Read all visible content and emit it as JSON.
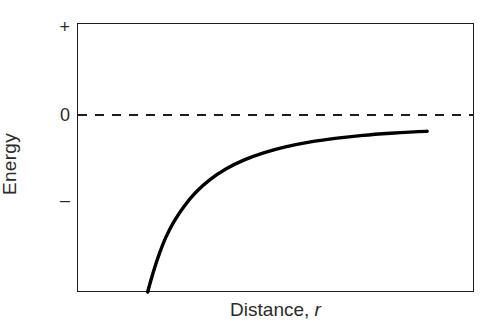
{
  "chart_data": {
    "type": "line",
    "title": "",
    "subtitle": "",
    "xlabel": "Distance, r",
    "xlabel_text": "Distance, ",
    "xlabel_variable": "r",
    "ylabel": "Energy",
    "grid": false,
    "legend": null,
    "xlim": [
      0,
      1
    ],
    "ylim": [
      -1,
      0.52
    ],
    "x_tick_labels": [],
    "y_tick_labels": [
      "+",
      "0",
      "–"
    ],
    "y_tick_values": [
      0.5,
      0,
      -0.48
    ],
    "annotations": [
      {
        "name": "zero-reference-line",
        "style": "dashed",
        "y_value": 0,
        "label": "0"
      }
    ],
    "series": [
      {
        "name": "attractive-potential-energy",
        "style": "solid",
        "color": "#000000",
        "line_width": 3.4,
        "description": "Energy rises steeply from a large negative value at small separation and approaches zero asymptotically at large distance",
        "x": [
          0.178,
          0.186,
          0.196,
          0.208,
          0.224,
          0.245,
          0.27,
          0.3,
          0.335,
          0.375,
          0.42,
          0.47,
          0.525,
          0.585,
          0.65,
          0.72,
          0.79,
          0.86,
          0.882
        ],
        "y": [
          -1.0,
          -0.935,
          -0.86,
          -0.78,
          -0.69,
          -0.6,
          -0.515,
          -0.435,
          -0.365,
          -0.305,
          -0.255,
          -0.214,
          -0.18,
          -0.153,
          -0.132,
          -0.115,
          -0.103,
          -0.094,
          -0.092
        ]
      }
    ],
    "axis_frame": {
      "color": "#1d1d1d",
      "all_sides": true
    },
    "zero_line_color": "#1d1d1d",
    "background_color": "#ffffff"
  }
}
